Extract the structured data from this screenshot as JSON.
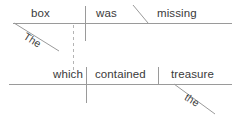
{
  "diagram": {
    "type": "reed-kellogg-sentence-diagram",
    "sentence": "The box was missing which contained the treasure",
    "canvas": {
      "width": 242,
      "height": 118
    },
    "colors": {
      "line": "#9a9a9a",
      "dashed_line": "#b4b4b4",
      "text": "#3a3a3a",
      "background": "#ffffff"
    },
    "clauses": [
      {
        "name": "main-clause",
        "baseline_y": 23,
        "words": [
          {
            "id": "subject",
            "label": "box",
            "role": "subject",
            "x": 31,
            "y": 8
          },
          {
            "id": "verb",
            "label": "was",
            "role": "verb",
            "x": 96,
            "y": 8
          },
          {
            "id": "predicate-adjective",
            "label": "missing",
            "role": "predicate-adjective",
            "x": 158,
            "y": 8
          },
          {
            "id": "article-the-1",
            "label": "The",
            "role": "article-modifier",
            "x": 18,
            "y": 28,
            "angle": 42
          }
        ]
      },
      {
        "name": "relative-clause",
        "baseline_y": 84,
        "words": [
          {
            "id": "relative-pronoun",
            "label": "which",
            "role": "relative-pronoun-subject",
            "x": 54,
            "y": 69
          },
          {
            "id": "verb-2",
            "label": "contained",
            "role": "verb",
            "x": 95,
            "y": 69
          },
          {
            "id": "direct-object",
            "label": "treasure",
            "role": "direct-object",
            "x": 172,
            "y": 69
          },
          {
            "id": "article-the-2",
            "label": "the",
            "role": "article-modifier",
            "x": 178,
            "y": 89,
            "angle": 42
          }
        ]
      }
    ],
    "lines": {
      "main_baseline": {
        "x1": 13,
        "y1": 23,
        "x2": 232,
        "y2": 23,
        "style": "solid"
      },
      "relative_baseline": {
        "x1": 9,
        "y1": 84,
        "x2": 232,
        "y2": 84,
        "style": "solid"
      },
      "subject_verb_divider": {
        "x1": 85,
        "y1": 6,
        "x2": 85,
        "y2": 41,
        "style": "solid"
      },
      "predicate_slant": {
        "x1": 133,
        "y1": 6,
        "x2": 147,
        "y2": 23,
        "style": "solid"
      },
      "article_slant_1": {
        "x1": 14,
        "y1": 23,
        "x2": 58,
        "y2": 50,
        "style": "solid"
      },
      "dashed_connector": {
        "x1": 73,
        "y1": 25,
        "x2": 73,
        "y2": 72,
        "style": "dashed"
      },
      "relative_subject_divider": {
        "x1": 86,
        "y1": 67,
        "x2": 86,
        "y2": 103,
        "style": "solid"
      },
      "direct_object_divider": {
        "x1": 158,
        "y1": 67,
        "x2": 158,
        "y2": 84,
        "style": "solid"
      },
      "article_slant_2": {
        "x1": 174,
        "y1": 84,
        "x2": 214,
        "y2": 113,
        "style": "solid"
      }
    }
  }
}
